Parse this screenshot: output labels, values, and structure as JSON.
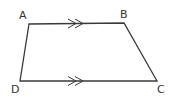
{
  "diagram": {
    "type": "trapezoid",
    "name": "ABCD",
    "stroke_color": "#3a3a3a",
    "vertices": [
      {
        "label": "A",
        "x": 29,
        "y": 24,
        "lx": 19,
        "ly": 19
      },
      {
        "label": "B",
        "x": 124,
        "y": 23,
        "lx": 120,
        "ly": 18
      },
      {
        "label": "C",
        "x": 157,
        "y": 81,
        "lx": 157,
        "ly": 93
      },
      {
        "label": "D",
        "x": 20,
        "y": 81,
        "lx": 11,
        "ly": 93
      }
    ],
    "parallel_marks": [
      {
        "side": "AB",
        "count": 2
      },
      {
        "side": "DC",
        "count": 2
      }
    ]
  }
}
